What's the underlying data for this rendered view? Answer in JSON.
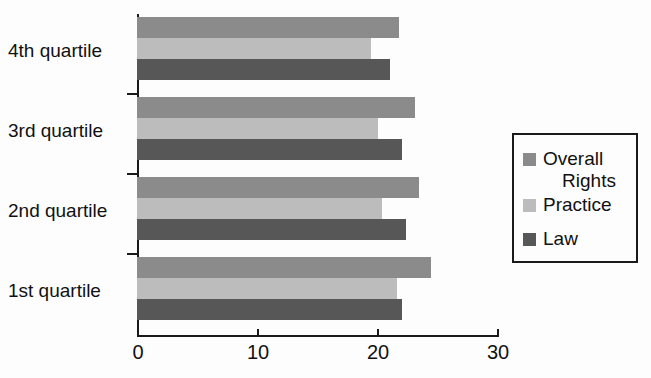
{
  "chart_data": {
    "type": "bar",
    "orientation": "horizontal",
    "title": "",
    "subtitle": "",
    "xlabel": "",
    "ylabel": "",
    "xlim": [
      0,
      30
    ],
    "xticks": [
      0,
      10,
      20,
      30
    ],
    "xtick_labels": [
      "0",
      "10",
      "20",
      "30"
    ],
    "grid": false,
    "legend_position": "right",
    "categories": [
      "1st quartile",
      "2nd quartile",
      "3rd quartile",
      "4th quartile"
    ],
    "category_order_top_to_bottom": [
      "4th quartile",
      "3rd quartile",
      "2nd quartile",
      "1st quartile"
    ],
    "series": [
      {
        "name": "Overall Rights",
        "color": "#8b8b8b",
        "values": [
          24.5,
          23.5,
          23.2,
          21.8
        ]
      },
      {
        "name": "Practice",
        "color": "#bcbcbc",
        "values": [
          21.7,
          20.4,
          20.1,
          19.5
        ]
      },
      {
        "name": "Law",
        "color": "#575757",
        "values": [
          22.1,
          22.4,
          22.1,
          21.1
        ]
      }
    ],
    "series_order_top_to_bottom_in_group": [
      "Overall Rights",
      "Practice",
      "Law"
    ]
  },
  "legend": {
    "entries": [
      {
        "label_line1": "Overall",
        "label_line2": "Rights",
        "swatch": "overall"
      },
      {
        "label_line1": "Practice",
        "label_line2": "",
        "swatch": "practice"
      },
      {
        "label_line1": "Law",
        "label_line2": "",
        "swatch": "law"
      }
    ]
  },
  "axis": {
    "x_tick_labels": [
      "0",
      "10",
      "20",
      "30"
    ],
    "y_tick_labels": [
      "4th quartile",
      "3rd quartile",
      "2nd quartile",
      "1st quartile"
    ]
  },
  "colors": {
    "overall_rights": "#8b8b8b",
    "practice": "#bcbcbc",
    "law": "#575757",
    "axis": "#1a1a1a",
    "background": "#fdfdfd"
  }
}
